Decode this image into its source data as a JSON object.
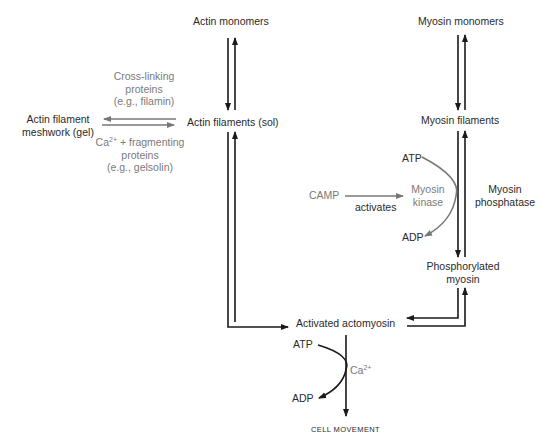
{
  "diagram": {
    "nodes": {
      "actin_monomers": "Actin monomers",
      "actin_filaments_sol": "Actin filaments (sol)",
      "actin_meshwork_line1": "Actin filament",
      "actin_meshwork_line2": "meshwork (gel)",
      "myosin_monomers": "Myosin monomers",
      "myosin_filaments": "Myosin filaments",
      "phosphorylated_line1": "Phosphorylated",
      "phosphorylated_line2": "myosin",
      "activated_actomyosin": "Activated actomyosin",
      "cell_movement": "CELL MOVEMENT"
    },
    "labels": {
      "crosslink_line1": "Cross-linking",
      "crosslink_line2": "proteins",
      "crosslink_line3": "(e.g., filamin)",
      "fragment_ca": "Ca",
      "fragment_ca_sup": "2+",
      "fragment_line1_rest": " + fragmenting",
      "fragment_line2": "proteins",
      "fragment_line3": "(e.g., gelsolin)",
      "camp": "CAMP",
      "activates": "activates",
      "myosin_kinase_line1": "Myosin",
      "myosin_kinase_line2": "kinase",
      "myosin_phosphatase_line1": "Myosin",
      "myosin_phosphatase_line2": "phosphatase",
      "atp_top": "ATP",
      "adp_top": "ADP",
      "atp_bottom": "ATP",
      "adp_bottom": "ADP",
      "ca_bottom": "Ca",
      "ca_bottom_sup": "2+"
    },
    "colors": {
      "black": "#1a1a1a",
      "gray": "#777777"
    }
  }
}
